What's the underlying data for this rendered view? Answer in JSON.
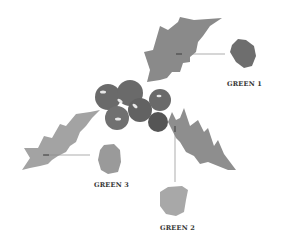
{
  "diagram": {
    "title": "",
    "colors": {
      "background": "#ffffff",
      "leaf_top": "#8a8a8a",
      "leaf_left": "#a3a3a3",
      "leaf_right": "#8e8e8e",
      "berries": "#6a6a6a",
      "berries_dark": "#555555",
      "swatch_green1": "#6e6e6e",
      "swatch_green2": "#a8a8a8",
      "swatch_green3": "#9a9a9a",
      "leader_line": "#888888",
      "label_text": "#333333"
    },
    "swatches": [
      {
        "id": "green1",
        "label": "GREEN 1"
      },
      {
        "id": "green2",
        "label": "GREEN 2"
      },
      {
        "id": "green3",
        "label": "GREEN 3"
      }
    ]
  }
}
